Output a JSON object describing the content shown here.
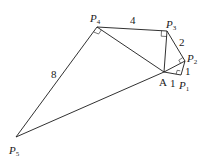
{
  "diagram": {
    "points": {
      "P1": {
        "label": "P",
        "sub": "1",
        "x": 181,
        "y": 75
      },
      "P2": {
        "label": "P",
        "sub": "2",
        "x": 185,
        "y": 61
      },
      "P3": {
        "label": "P",
        "sub": "3",
        "x": 167,
        "y": 31
      },
      "P4": {
        "label": "P",
        "sub": "4",
        "x": 97,
        "y": 27
      },
      "P5": {
        "label": "P",
        "sub": "5",
        "x": 16,
        "y": 137
      },
      "A": {
        "label": "A",
        "x": 164,
        "y": 72
      }
    },
    "edge_labels": {
      "AP1": "1",
      "P1P2": "1",
      "P2P3": "2",
      "P3P4": "4",
      "P4P5": "8"
    }
  }
}
